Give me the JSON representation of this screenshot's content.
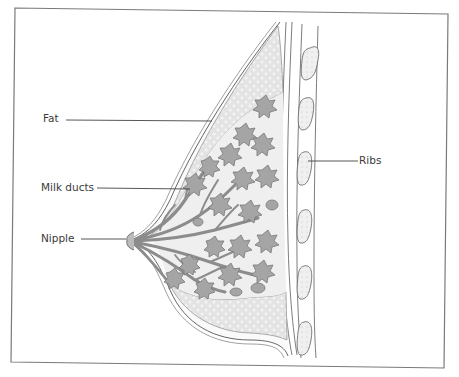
{
  "figure": {
    "frame_color": "#7a7a7a",
    "line_color": "#555555",
    "fat_color": "#d9d9d9",
    "lobule_color": "#9a9a9a",
    "duct_color": "#a8a8a8"
  },
  "labels": {
    "fat": "Fat",
    "milk_ducts": "Milk ducts",
    "nipple": "Nipple",
    "ribs": "Ribs"
  }
}
